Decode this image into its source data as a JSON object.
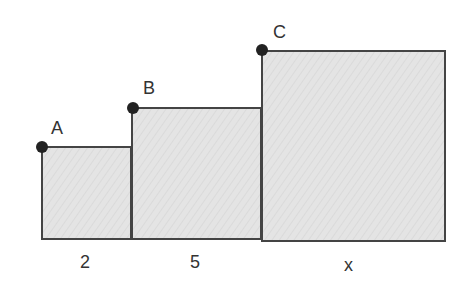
{
  "diagram": {
    "colors": {
      "fill": "#e3e3e3",
      "stroke": "#444444",
      "point": "#222222",
      "text": "#333333"
    },
    "squares": [
      {
        "id": "square-a",
        "side_label": "2",
        "point_label": "A"
      },
      {
        "id": "square-b",
        "side_label": "5",
        "point_label": "B"
      },
      {
        "id": "square-c",
        "side_label": "x",
        "point_label": "C"
      }
    ],
    "points": [
      "A",
      "B",
      "C"
    ]
  }
}
